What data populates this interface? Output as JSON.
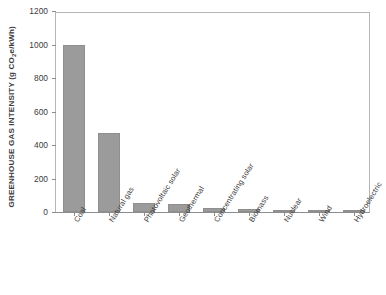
{
  "chart_data": {
    "type": "bar",
    "title": "",
    "xlabel": "",
    "ylabel": "GREENHOUSE GAS INTENSITY (g CO2e/kWh)",
    "ylabel_parts": {
      "before": "GREENHOUSE GAS INTENSITY (g CO",
      "subscript": "2",
      "after": "e/kWh)"
    },
    "ylim": [
      0,
      1200
    ],
    "yticks": [
      0,
      200,
      400,
      600,
      800,
      1000,
      1200
    ],
    "ytick_labels": [
      "0",
      "200",
      "400",
      "600",
      "800",
      "1000",
      "1200"
    ],
    "grid": false,
    "legend": null,
    "bar_color": "#9b9b9b",
    "axis_color": "#8c8c8c",
    "categories": [
      "Coal",
      "Natural gas",
      "Photovoltaic solar",
      "Geothermal",
      "Concentrating solar",
      "Biomass",
      "Nuclear",
      "Wind",
      "Hydroelectric"
    ],
    "values": [
      1000,
      470,
      55,
      50,
      25,
      20,
      15,
      12,
      8
    ]
  }
}
